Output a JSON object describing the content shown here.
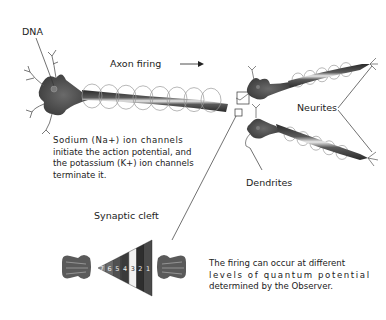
{
  "labels": {
    "dna": "DNA",
    "axon_firing": "Axon firing",
    "neurites": "Neurites",
    "dendrites": "Dendrites",
    "synaptic_cleft": "Synaptic cleft"
  },
  "captions": {
    "ion_channels": [
      "Sodium (Na+) ion channels",
      "initiate the action potential, and",
      "the potassium (K+) ion channels",
      "terminate it."
    ],
    "quantum": [
      "The firing can occur at different",
      "levels of quantum potential",
      "determined by the Observer."
    ]
  },
  "cleft_levels": [
    "7",
    "6",
    "5",
    "4",
    "3",
    "2",
    "1"
  ],
  "colors": {
    "neuron": "#3d3d3d",
    "axon_highlight": "#e6e6e6",
    "ion_loops": "#9a9a9a",
    "ink": "#222222"
  }
}
